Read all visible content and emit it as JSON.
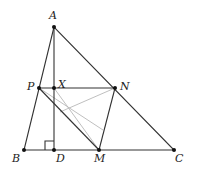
{
  "points": {
    "A": {
      "label": "A",
      "x": 54,
      "y": 27
    },
    "B": {
      "label": "B",
      "x": 24,
      "y": 150
    },
    "C": {
      "label": "C",
      "x": 174,
      "y": 150
    },
    "D": {
      "label": "D",
      "x": 54,
      "y": 150
    },
    "M": {
      "label": "M",
      "x": 99,
      "y": 150
    },
    "P": {
      "label": "P",
      "x": 39,
      "y": 88
    },
    "X": {
      "label": "X",
      "x": 54,
      "y": 88
    },
    "N": {
      "label": "N",
      "x": 115,
      "y": 88
    }
  },
  "colors": {
    "line": "#333333",
    "light": "#b8b8b8",
    "point": "#111111"
  }
}
